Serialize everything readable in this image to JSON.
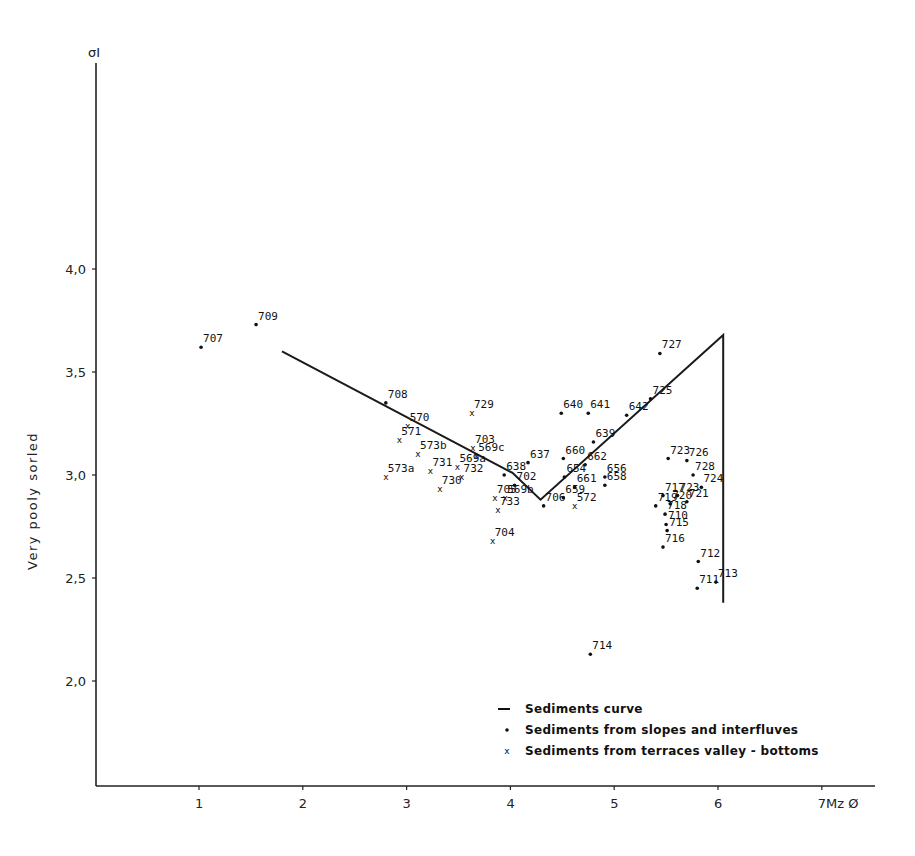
{
  "chart_data": {
    "type": "scatter",
    "title": "",
    "xlabel": "Mz Ø",
    "ylabel": "σI",
    "ylabel_side_text": "Very pooly sorled",
    "xlim": [
      0,
      7.5
    ],
    "ylim": [
      1.5,
      5.0
    ],
    "x_ticks": [
      1,
      2,
      3,
      4,
      5,
      6,
      7
    ],
    "x_tick_labels": [
      "1",
      "2",
      "3",
      "4",
      "5",
      "6",
      "7Mz Ø"
    ],
    "y_ticks": [
      2.0,
      2.5,
      3.0,
      3.5,
      4.0
    ],
    "y_tick_labels": [
      "2,0",
      "2,5",
      "3,0",
      "3,5",
      "4,0"
    ],
    "grid": false,
    "legend_position": "lower right",
    "legend": [
      {
        "symbol": "line",
        "label": "Sediments curve"
      },
      {
        "symbol": "dot",
        "label": "Sediments from slopes and interfluves"
      },
      {
        "symbol": "x",
        "label": "Sediments from terraces valley - bottoms"
      }
    ],
    "series": [
      {
        "name": "Sediments curve",
        "kind": "line",
        "points": [
          [
            1.8,
            3.6
          ],
          [
            4.02,
            3.01
          ],
          [
            4.29,
            2.88
          ],
          [
            6.05,
            3.68
          ],
          [
            6.05,
            2.38
          ]
        ]
      },
      {
        "name": "Sediments from slopes and interfluves",
        "kind": "dot",
        "points": [
          {
            "id": "707",
            "x": 1.02,
            "y": 3.62
          },
          {
            "id": "709",
            "x": 1.55,
            "y": 3.73
          },
          {
            "id": "708",
            "x": 2.8,
            "y": 3.35
          },
          {
            "id": "638",
            "x": 3.94,
            "y": 3.0
          },
          {
            "id": "637",
            "x": 4.17,
            "y": 3.06
          },
          {
            "id": "702",
            "x": 4.04,
            "y": 2.95
          },
          {
            "id": "706",
            "x": 4.32,
            "y": 2.85
          },
          {
            "id": "654",
            "x": 4.52,
            "y": 2.99
          },
          {
            "id": "660",
            "x": 4.51,
            "y": 3.08
          },
          {
            "id": "640",
            "x": 4.49,
            "y": 3.3
          },
          {
            "id": "641",
            "x": 4.75,
            "y": 3.3
          },
          {
            "id": "639",
            "x": 4.8,
            "y": 3.16
          },
          {
            "id": "662",
            "x": 4.72,
            "y": 3.05
          },
          {
            "id": "661",
            "x": 4.62,
            "y": 2.94
          },
          {
            "id": "659",
            "x": 4.51,
            "y": 2.89
          },
          {
            "id": "656",
            "x": 4.91,
            "y": 2.99
          },
          {
            "id": "658",
            "x": 4.91,
            "y": 2.95
          },
          {
            "id": "642",
            "x": 5.12,
            "y": 3.29
          },
          {
            "id": "725",
            "x": 5.35,
            "y": 3.37
          },
          {
            "id": "727",
            "x": 5.44,
            "y": 3.59
          },
          {
            "id": "723",
            "x": 5.52,
            "y": 3.08
          },
          {
            "id": "726",
            "x": 5.7,
            "y": 3.07
          },
          {
            "id": "728",
            "x": 5.76,
            "y": 3.0
          },
          {
            "id": "724",
            "x": 5.84,
            "y": 2.94
          },
          {
            "id": "723",
            "x": 5.61,
            "y": 2.9
          },
          {
            "id": "717",
            "x": 5.47,
            "y": 2.9
          },
          {
            "id": "721",
            "x": 5.7,
            "y": 2.87
          },
          {
            "id": "719",
            "x": 5.4,
            "y": 2.85
          },
          {
            "id": "720",
            "x": 5.54,
            "y": 2.86
          },
          {
            "id": "718",
            "x": 5.49,
            "y": 2.81
          },
          {
            "id": "710",
            "x": 5.5,
            "y": 2.76
          },
          {
            "id": "715",
            "x": 5.51,
            "y": 2.73
          },
          {
            "id": "716",
            "x": 5.47,
            "y": 2.65
          },
          {
            "id": "712",
            "x": 5.81,
            "y": 2.58
          },
          {
            "id": "713",
            "x": 5.98,
            "y": 2.48
          },
          {
            "id": "711",
            "x": 5.8,
            "y": 2.45
          },
          {
            "id": "714",
            "x": 4.77,
            "y": 2.13
          }
        ]
      },
      {
        "name": "Sediments from terraces valley - bottoms",
        "kind": "x",
        "points": [
          {
            "id": "570",
            "x": 3.01,
            "y": 3.24
          },
          {
            "id": "571",
            "x": 2.93,
            "y": 3.17
          },
          {
            "id": "573b",
            "x": 3.11,
            "y": 3.1
          },
          {
            "id": "573a",
            "x": 2.8,
            "y": 2.99
          },
          {
            "id": "731",
            "x": 3.23,
            "y": 3.02
          },
          {
            "id": "569a",
            "x": 3.49,
            "y": 3.04
          },
          {
            "id": "730",
            "x": 3.32,
            "y": 2.93
          },
          {
            "id": "732",
            "x": 3.53,
            "y": 2.99
          },
          {
            "id": "729",
            "x": 3.63,
            "y": 3.3
          },
          {
            "id": "703",
            "x": 3.64,
            "y": 3.13
          },
          {
            "id": "569c",
            "x": 3.67,
            "y": 3.09
          },
          {
            "id": "705",
            "x": 3.85,
            "y": 2.89
          },
          {
            "id": "569b",
            "x": 3.95,
            "y": 2.89
          },
          {
            "id": "733",
            "x": 3.88,
            "y": 2.83
          },
          {
            "id": "704",
            "x": 3.83,
            "y": 2.68
          },
          {
            "id": "572",
            "x": 4.62,
            "y": 2.85
          }
        ]
      }
    ]
  },
  "labels": {
    "y_axis_symbol": "σI",
    "y_side_text": "Very pooly sorled",
    "x_axis_end": "7Mz Ø"
  }
}
